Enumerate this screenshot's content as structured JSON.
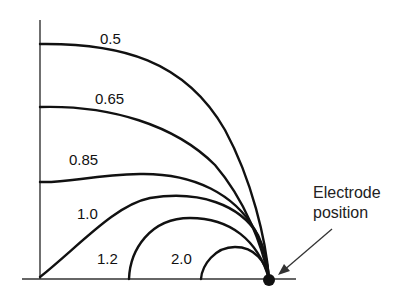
{
  "diagram": {
    "type": "equipotential-contours",
    "contour_labels": [
      "0.5",
      "0.65",
      "0.85",
      "1.0",
      "1.2",
      "2.0"
    ],
    "annotation": {
      "line1": "Electrode",
      "line2": "position"
    },
    "colors": {
      "curve": "#111111",
      "axis": "#333333",
      "background": "#ffffff"
    }
  }
}
